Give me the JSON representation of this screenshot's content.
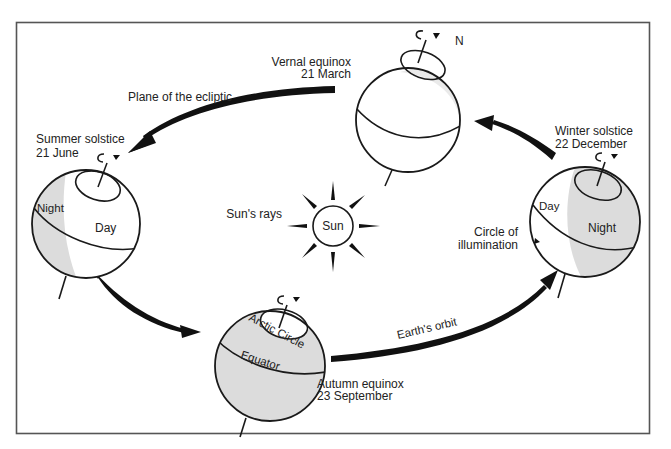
{
  "diagram": {
    "sun": {
      "label": "Sun",
      "rays_label": "Sun's rays"
    },
    "positions": [
      {
        "id": "vernal",
        "name": "Vernal equinox",
        "date": "21 March",
        "pole_label": "N"
      },
      {
        "id": "summer",
        "name": "Summer solstice",
        "date": "21 June",
        "night_label": "Night",
        "day_label": "Day"
      },
      {
        "id": "autumn",
        "name": "Autumn equinox",
        "date": "23 September",
        "arctic_label": "Arctic Circle",
        "equator_label": "Equator"
      },
      {
        "id": "winter",
        "name": "Winter solstice",
        "date": "22 December",
        "night_label": "Night",
        "day_label": "Day"
      }
    ],
    "annotations": {
      "ecliptic": "Plane of the ecliptic",
      "orbit": "Earth's orbit",
      "illumination_line1": "Circle of",
      "illumination_line2": "illumination"
    },
    "colors": {
      "ink": "#1a1a1a",
      "shade": "#dcdcdc",
      "frame": "#555555",
      "background": "#ffffff"
    }
  }
}
